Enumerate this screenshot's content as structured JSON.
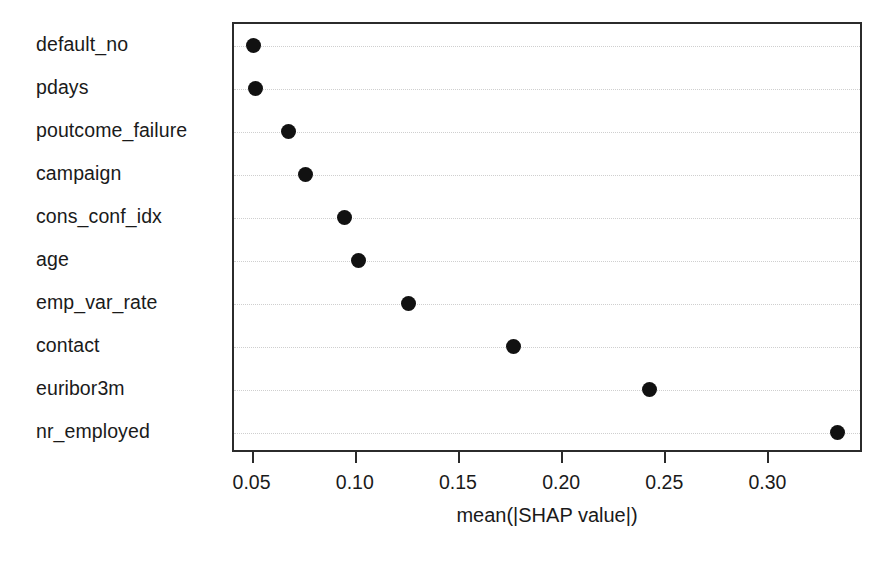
{
  "chart_data": {
    "type": "scatter",
    "title": "",
    "subtitle": "",
    "xlabel": "mean(|SHAP value|)",
    "ylabel": "",
    "orientation": "horizontal",
    "grid": "horizontal-dotted",
    "legend": "none",
    "xlim": [
      0.0405,
      0.3458
    ],
    "xticks": [
      0.05,
      0.1,
      0.15,
      0.2,
      0.25,
      0.3
    ],
    "xticklabels": [
      "0.05",
      "0.10",
      "0.15",
      "0.20",
      "0.25",
      "0.30"
    ],
    "categories": [
      "default_no",
      "pdays",
      "poutcome_failure",
      "campaign",
      "cons_conf_idx",
      "age",
      "emp_var_rate",
      "contact",
      "euribor3m",
      "nr_employed"
    ],
    "values": [
      0.05,
      0.051,
      0.067,
      0.075,
      0.094,
      0.101,
      0.125,
      0.176,
      0.242,
      0.333
    ],
    "points": [
      {
        "label": "default_no",
        "value": 0.05
      },
      {
        "label": "pdays",
        "value": 0.051
      },
      {
        "label": "poutcome_failure",
        "value": 0.067
      },
      {
        "label": "campaign",
        "value": 0.075
      },
      {
        "label": "cons_conf_idx",
        "value": 0.094
      },
      {
        "label": "age",
        "value": 0.101
      },
      {
        "label": "emp_var_rate",
        "value": 0.125
      },
      {
        "label": "contact",
        "value": 0.176
      },
      {
        "label": "euribor3m",
        "value": 0.242
      },
      {
        "label": "nr_employed",
        "value": 0.333
      }
    ],
    "colors": {
      "marker": "#111111",
      "frame": "#2b2b2b",
      "grid": "#cfcfcf",
      "text": "#1a1a1a",
      "background": "#ffffff"
    }
  }
}
